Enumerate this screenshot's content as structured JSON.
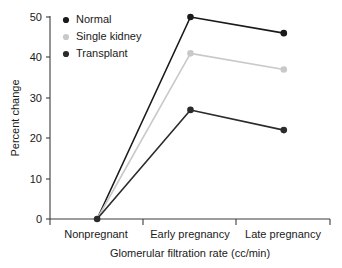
{
  "chart_data": {
    "type": "line",
    "title": "",
    "subtitle": "",
    "xlabel": "Glomerular filtration rate (cc/min)",
    "ylabel": "Percent change",
    "categories": [
      "Nonpregnant",
      "Early pregnancy",
      "Late pregnancy"
    ],
    "series": [
      {
        "name": "Normal",
        "values": [
          0,
          50,
          46
        ],
        "color": "#1a1a1a"
      },
      {
        "name": "Single kidney",
        "values": [
          0,
          41,
          37
        ],
        "color": "#c9c9c9"
      },
      {
        "name": "Transplant",
        "values": [
          0,
          27,
          22
        ],
        "color": "#2b2b2b"
      }
    ],
    "ylim": [
      0,
      50
    ],
    "yticks": [
      0,
      10,
      20,
      30,
      40,
      50
    ],
    "ytick_labels": [
      "0",
      "10",
      "20",
      "30",
      "40",
      "50"
    ],
    "xtick_labels": [
      "Nonpregnant",
      "Early pregnancy",
      "Late pregnancy"
    ],
    "grid": false,
    "legend_position": "top-left",
    "marker": "circle",
    "spines": [
      "left",
      "bottom"
    ]
  },
  "legend": {
    "entries": [
      {
        "label": "Normal",
        "color": "#1a1a1a"
      },
      {
        "label": "Single kidney",
        "color": "#c9c9c9"
      },
      {
        "label": "Transplant",
        "color": "#2b2b2b"
      }
    ]
  },
  "axes": {
    "y_title": "Percent change",
    "x_title": "Glomerular filtration rate (cc/min)",
    "y_labels": [
      "50",
      "40",
      "30",
      "20",
      "10",
      "0"
    ],
    "x_labels": [
      "Nonpregnant",
      "Early pregnancy",
      "Late pregnancy"
    ]
  }
}
